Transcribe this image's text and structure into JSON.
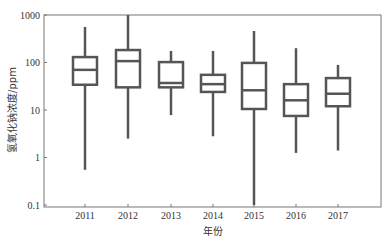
{
  "chart_data": {
    "type": "boxplot",
    "title": "",
    "xlabel": "年份",
    "ylabel": "氢氧化钠浓度/ppm",
    "yscale": "log",
    "ylim": [
      0.1,
      1000
    ],
    "yticks": [
      0.1,
      1,
      10,
      100,
      1000
    ],
    "ytick_labels": [
      "0.1",
      "1",
      "10",
      "100",
      "1000"
    ],
    "categories": [
      "2011",
      "2012",
      "2013",
      "2014",
      "2015",
      "2016",
      "2017"
    ],
    "series": [
      {
        "category": "2011",
        "whisker_low": 0.55,
        "q1": 34,
        "median": 70,
        "q3": 130,
        "whisker_high": 560
      },
      {
        "category": "2012",
        "whisker_low": 2.5,
        "q1": 30,
        "median": 107,
        "q3": 183,
        "whisker_high": 1000
      },
      {
        "category": "2013",
        "whisker_low": 7.8,
        "q1": 30,
        "median": 37,
        "q3": 102,
        "whisker_high": 175
      },
      {
        "category": "2014",
        "whisker_low": 2.8,
        "q1": 24,
        "median": 35,
        "q3": 55,
        "whisker_high": 175
      },
      {
        "category": "2015",
        "whisker_low": 0.1,
        "q1": 10.5,
        "median": 26,
        "q3": 98,
        "whisker_high": 460
      },
      {
        "category": "2016",
        "whisker_low": 1.25,
        "q1": 7.5,
        "median": 16,
        "q3": 35,
        "whisker_high": 200
      },
      {
        "category": "2017",
        "whisker_low": 1.4,
        "q1": 12,
        "median": 22,
        "q3": 47,
        "whisker_high": 89
      }
    ],
    "grid": false,
    "legend": null,
    "colors": {
      "box_stroke": "#555555",
      "axis": "#666666",
      "background": "#ffffff"
    }
  }
}
